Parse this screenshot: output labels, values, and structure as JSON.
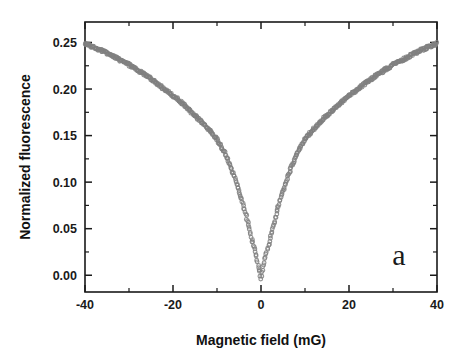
{
  "figure": {
    "panel_label": "a",
    "background_color": "#ffffff",
    "frame_color": "#1a1a1a"
  },
  "chart_data": {
    "type": "scatter",
    "title": "",
    "xlabel": "Magnetic field (mG)",
    "ylabel": "Normalized fluorescence",
    "xlim": [
      -40,
      40
    ],
    "ylim": [
      -0.018,
      0.272
    ],
    "grid": false,
    "legend": null,
    "marker_color": "#808080",
    "marker_style": "open-circle",
    "x_ticks": [
      -40,
      -20,
      0,
      20,
      40
    ],
    "x_tick_labels": [
      "-40",
      "-20",
      "0",
      "20",
      "40"
    ],
    "x_minor_tick_interval": 10,
    "y_ticks": [
      0.0,
      0.05,
      0.1,
      0.15,
      0.2,
      0.25
    ],
    "y_tick_labels": [
      "0.00",
      "0.05",
      "0.10",
      "0.15",
      "0.20",
      "0.25"
    ],
    "y_minor_tick_interval": 0.025,
    "series": [
      {
        "name": "Normalized fluorescence vs magnetic field",
        "x": [
          -40,
          -38,
          -36,
          -34,
          -32,
          -30,
          -28,
          -26,
          -24,
          -22,
          -20,
          -18,
          -16,
          -14,
          -12,
          -10,
          -8,
          -6,
          -5,
          -4,
          -3,
          -2,
          -1.5,
          -1,
          -0.5,
          0,
          0.5,
          1,
          1.5,
          2,
          3,
          4,
          5,
          6,
          8,
          10,
          12,
          14,
          16,
          18,
          20,
          22,
          24,
          26,
          28,
          30,
          32,
          34,
          36,
          38,
          40
        ],
        "y": [
          0.249,
          0.245,
          0.241,
          0.236,
          0.231,
          0.226,
          0.22,
          0.214,
          0.207,
          0.2,
          0.193,
          0.185,
          0.176,
          0.167,
          0.157,
          0.146,
          0.129,
          0.105,
          0.091,
          0.075,
          0.057,
          0.038,
          0.029,
          0.019,
          0.009,
          -0.003,
          0.009,
          0.019,
          0.029,
          0.038,
          0.057,
          0.075,
          0.091,
          0.105,
          0.129,
          0.146,
          0.157,
          0.167,
          0.176,
          0.185,
          0.193,
          0.2,
          0.207,
          0.214,
          0.22,
          0.226,
          0.231,
          0.236,
          0.241,
          0.245,
          0.249
        ]
      }
    ]
  }
}
